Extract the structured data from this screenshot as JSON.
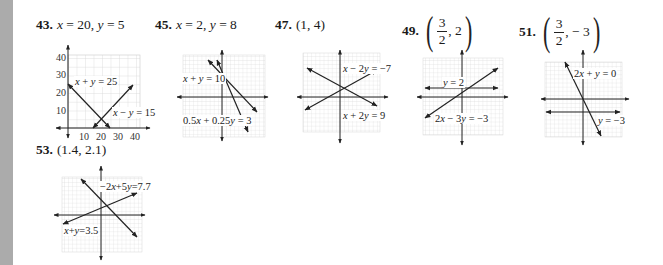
{
  "problems": [
    {
      "number": "43.",
      "answer": "x = 20, y = 5",
      "graph": {
        "lines": [
          "x + y = 25",
          "x − y = 15"
        ],
        "y_ticks": [
          "40",
          "30",
          "20",
          "10"
        ],
        "x_ticks": [
          "10",
          "20",
          "30",
          "40"
        ]
      }
    },
    {
      "number": "45.",
      "answer": "x = 2, y = 8",
      "graph": {
        "lines": [
          "x + y = 10",
          "0.5x + 0.25y = 3"
        ]
      }
    },
    {
      "number": "47.",
      "answer": "(1, 4)",
      "graph": {
        "lines": [
          "x − 2y = −7",
          "x + 2y = 9"
        ]
      }
    },
    {
      "number": "49.",
      "answer": {
        "open": "(",
        "numerator": "3",
        "denominator": "2",
        "rest": ", 2",
        "close": ")"
      },
      "graph": {
        "lines": [
          "y = 2",
          "2x − 3y = −3"
        ]
      }
    },
    {
      "number": "51.",
      "answer": {
        "open": "(",
        "numerator": "3",
        "denominator": "2",
        "rest": ", − 3",
        "close": ")"
      },
      "graph": {
        "lines": [
          "2x + y = 0",
          "y = −3"
        ]
      }
    },
    {
      "number": "53.",
      "answer": "(1.4, 2.1)",
      "graph": {
        "lines": [
          "−2x+5y=7.7",
          "x+y=3.5"
        ]
      }
    }
  ],
  "colors": {
    "sidebar": "#ababab",
    "grid": "#d2d2d2",
    "ink": "#222222"
  }
}
